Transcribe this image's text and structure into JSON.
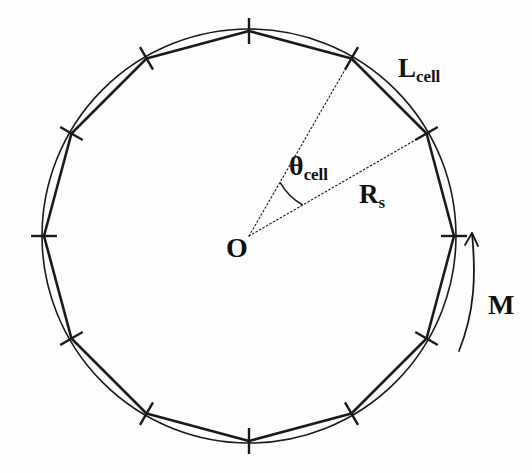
{
  "figure": {
    "background_color": "#fdfdfd",
    "stroke_color": "#1a1a1a",
    "labels": {
      "cell_length": {
        "base": "L",
        "sub": "cell",
        "name": "L-cell"
      },
      "cell_angle": {
        "base": "θ",
        "sub": "cell",
        "name": "theta-cell"
      },
      "stator_radius": {
        "base": "R",
        "sub": "s",
        "name": "R-s"
      },
      "center": {
        "base": "O",
        "sub": "",
        "name": "O"
      },
      "moment": {
        "base": "M",
        "sub": "",
        "name": "M"
      }
    }
  },
  "geometry": {
    "center": {
      "x": 249,
      "y": 236
    },
    "circle_radius": 207,
    "polygon_radius": 205,
    "num_cells": 12,
    "cell_angle_degrees": 30,
    "tick_half_length": 13,
    "vertex_angles_degrees": [
      90,
      60,
      30,
      0,
      -30,
      -60,
      -90,
      -120,
      -150,
      180,
      150,
      120
    ],
    "angle_marked_from_degrees": 30,
    "angle_marked_to_degrees": 60,
    "angle_arc_radius": 62,
    "moment_arrow": {
      "direction": "counterclockwise",
      "start": {
        "x": 459,
        "y": 351
      },
      "end": {
        "x": 472,
        "y": 233
      }
    }
  }
}
